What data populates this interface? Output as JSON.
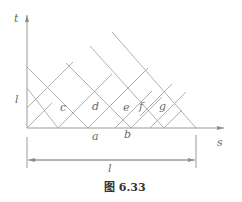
{
  "figure": {
    "caption": "图 6.33",
    "axes": {
      "vertical_label": "t",
      "horizontal_label": "s",
      "tick_label_t": "l"
    },
    "cells": [
      {
        "label": "c",
        "x": 63,
        "y": 110
      },
      {
        "label": "d",
        "x": 96,
        "y": 109
      },
      {
        "label": "e",
        "x": 126,
        "y": 110
      },
      {
        "label": "f",
        "x": 143,
        "y": 109
      },
      {
        "label": "g",
        "x": 163,
        "y": 109
      }
    ],
    "points": [
      {
        "label": "a",
        "x": 97,
        "y": 139
      },
      {
        "label": "b",
        "x": 129,
        "y": 137
      }
    ],
    "dimension": {
      "label": "l"
    },
    "colors": {
      "lines": "#a8a8a8",
      "text": "#6a6a6a",
      "caption": "#333333"
    }
  }
}
